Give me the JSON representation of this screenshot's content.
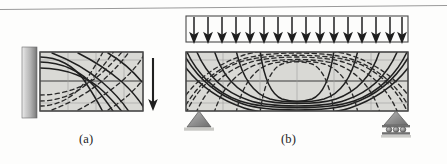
{
  "figure": {
    "background_color": "#fdfdfc",
    "beam_fill_color": "#d9d9d5",
    "line_color": "#1f1f1f",
    "support_fill_color": "#8a8a8a",
    "wall_color_light": "#e6e6e6",
    "wall_color_dark": "#6f6f6f"
  },
  "panels": [
    {
      "id": "a",
      "caption": "(a)",
      "name": "cantilever-beam-with-tip-load",
      "beam": {
        "x": 40,
        "y": 52,
        "width": 103,
        "height": 59,
        "neutral_axis_y": 81
      },
      "support": {
        "type": "fixed-wall",
        "x": 22,
        "y": 47,
        "width": 15,
        "height": 71
      },
      "load": {
        "type": "point-load-arrow",
        "direction": "down",
        "x": 153,
        "y_start": 58,
        "y_end": 110
      },
      "stress_trajectories": {
        "solid_curves": 5,
        "dashed_curves": 5,
        "description": "tension and compression principal stress trajectories"
      }
    },
    {
      "id": "b",
      "caption": "(b)",
      "name": "simply-supported-beam-with-uniform-load",
      "beam": {
        "x": 186,
        "y": 52,
        "width": 222,
        "height": 59,
        "neutral_axis_y": 81
      },
      "load": {
        "type": "uniformly-distributed-load",
        "direction": "down",
        "box": {
          "x": 186,
          "y": 16,
          "width": 222,
          "height": 26
        },
        "arrow_count": 16
      },
      "supports": [
        {
          "type": "pin-support",
          "x": 199,
          "y": 111,
          "half_width": 12,
          "height": 16
        },
        {
          "type": "roller-support",
          "x": 396,
          "y": 111,
          "half_width": 12,
          "height": 16,
          "roller_count": 3
        }
      ],
      "stress_trajectories": {
        "solid_curves": 6,
        "dashed_curves": 6,
        "description": "tension and compression principal stress trajectories"
      }
    }
  ],
  "decorations": {
    "top_rule": {
      "name": "page-rule",
      "visible": true,
      "color": "#8d8d8d"
    }
  }
}
